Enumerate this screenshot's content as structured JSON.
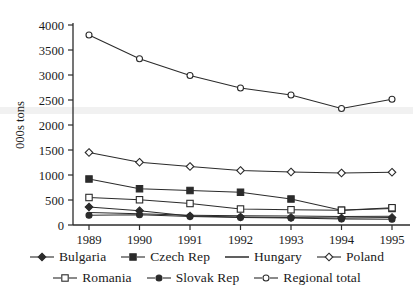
{
  "chart_data": {
    "type": "line",
    "title": "",
    "xlabel": "",
    "ylabel": "000s tons",
    "x": [
      "1989",
      "1990",
      "1991",
      "1992",
      "1993",
      "1994",
      "1995"
    ],
    "categories": [
      "1989",
      "1990",
      "1991",
      "1992",
      "1993",
      "1994",
      "1995"
    ],
    "ylim": [
      0,
      4000
    ],
    "yticks": [
      0,
      500,
      1000,
      1500,
      2000,
      2500,
      3000,
      3500,
      4000
    ],
    "ytick_labels": [
      "0",
      "500",
      "1000",
      "1500",
      "2000",
      "2500",
      "3000",
      "3500",
      "4000"
    ],
    "grid": false,
    "legend_position": "bottom",
    "series": [
      {
        "name": "Bulgaria",
        "marker": "filled-diamond",
        "values": [
          360,
          285,
          180,
          160,
          150,
          140,
          150
        ]
      },
      {
        "name": "Czech Rep",
        "marker": "filled-square",
        "values": [
          920,
          725,
          690,
          655,
          520,
          295,
          330
        ]
      },
      {
        "name": "Hungary",
        "marker": "none",
        "values": [
          250,
          225,
          195,
          185,
          180,
          170,
          175
        ]
      },
      {
        "name": "Poland",
        "marker": "open-diamond",
        "values": [
          1450,
          1255,
          1170,
          1090,
          1060,
          1040,
          1055
        ]
      },
      {
        "name": "Romania",
        "marker": "open-square",
        "values": [
          550,
          505,
          430,
          320,
          305,
          295,
          345
        ]
      },
      {
        "name": "Slovak Rep",
        "marker": "filled-circle",
        "values": [
          195,
          205,
          170,
          150,
          140,
          120,
          115
        ]
      },
      {
        "name": "Regional total",
        "marker": "open-circle",
        "values": [
          3800,
          3325,
          2990,
          2740,
          2600,
          2330,
          2515
        ]
      }
    ]
  },
  "axis": {
    "y_title": "000s tons",
    "y_ticks": [
      "4000",
      "3500",
      "3000",
      "2500",
      "2000",
      "1500",
      "1000",
      "500",
      "0"
    ],
    "x_ticks": [
      "1989",
      "1990",
      "1991",
      "1992",
      "1993",
      "1994",
      "1995"
    ]
  },
  "legend": {
    "row1": [
      {
        "label": "Bulgaria",
        "marker": "filled-diamond"
      },
      {
        "label": "Czech Rep",
        "marker": "filled-square"
      },
      {
        "label": "Hungary",
        "marker": "none"
      },
      {
        "label": "Poland",
        "marker": "open-diamond"
      }
    ],
    "row2": [
      {
        "label": "Romania",
        "marker": "open-square"
      },
      {
        "label": "Slovak Rep",
        "marker": "filled-circle"
      },
      {
        "label": "Regional total",
        "marker": "open-circle"
      }
    ]
  },
  "colors": {
    "line": "#2b2b2b",
    "axis": "#2b2b2b",
    "text": "#1a1a1a",
    "background": "#ffffff"
  }
}
